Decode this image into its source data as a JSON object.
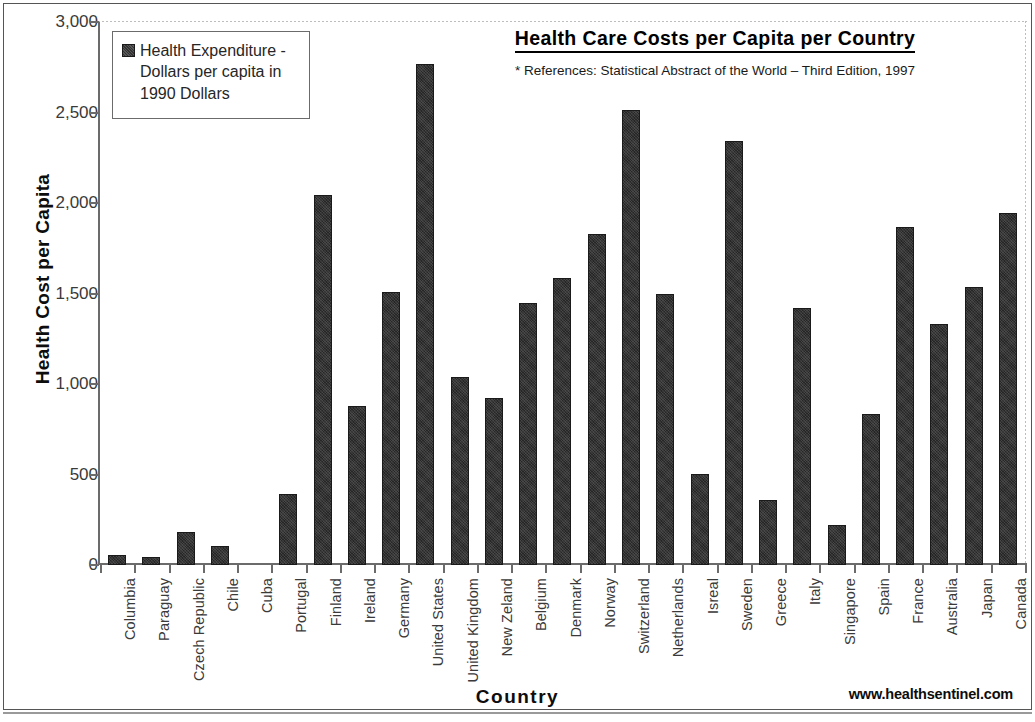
{
  "chart_data": {
    "type": "bar",
    "title": "Health Care Costs per Capita per Country",
    "subtitle": "* References: Statistical Abstract of the World – Third Edition, 1997",
    "xlabel": "Country",
    "ylabel": "Health Cost per Capita",
    "ylim": [
      0,
      3000
    ],
    "yticks": [
      "0",
      "500",
      "1,000",
      "1,500",
      "2,000",
      "2,500",
      "3,000"
    ],
    "ytick_values": [
      0,
      500,
      1000,
      1500,
      2000,
      2500,
      3000
    ],
    "grid": false,
    "legend_position": "upper-left-inside",
    "legend": [
      "Health Expenditure - Dollars per capita in 1990 Dollars"
    ],
    "series_name": "Health Expenditure - Dollars per capita in 1990 Dollars",
    "bar_color": "#333333",
    "categories": [
      "Columbia",
      "Paraguay",
      "Czech Republic",
      "Chile",
      "Cuba",
      "Portugal",
      "Finland",
      "Ireland",
      "Germany",
      "United States",
      "United Kingdom",
      "New Zeland",
      "Belgium",
      "Denmark",
      "Norway",
      "Switzerland",
      "Netherlands",
      "Isreal",
      "Sweden",
      "Greece",
      "Italy",
      "Singapore",
      "Spain",
      "France",
      "Australia",
      "Japan",
      "Canada"
    ],
    "values": [
      55,
      45,
      180,
      105,
      0,
      390,
      2045,
      880,
      1510,
      2770,
      1040,
      925,
      1445,
      1585,
      1830,
      2515,
      1500,
      505,
      2340,
      360,
      1420,
      220,
      835,
      1870,
      1330,
      1535,
      1945
    ],
    "annotations": [
      "www.healthsentinel.com"
    ]
  },
  "legend": {
    "line1": "Health Expenditure -",
    "line2": "Dollars per capita in",
    "line3": "1990 Dollars"
  },
  "footer": {
    "site": "www.healthsentinel.com"
  }
}
